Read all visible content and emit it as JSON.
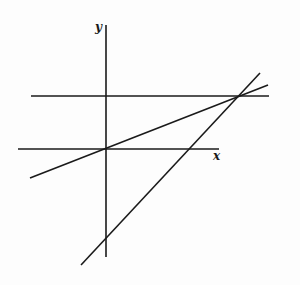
{
  "figure": {
    "width": 300,
    "height": 285,
    "background": "#fdfdfd",
    "stroke_color": "#1a1a1a"
  },
  "axes": {
    "x_label": "x",
    "y_label": "y",
    "origin": [
      106,
      149
    ],
    "x_axis": {
      "x1": 18,
      "y1": 149,
      "x2": 219,
      "y2": 149
    },
    "y_axis": {
      "x1": 106,
      "y1": 25,
      "x2": 106,
      "y2": 257
    },
    "x_label_pos": [
      213,
      160
    ],
    "y_label_pos": [
      95,
      31
    ]
  },
  "lines": [
    {
      "name": "horizontal-line",
      "description": "horizontal line above x-axis",
      "x1": 31,
      "y1": 96,
      "x2": 269,
      "y2": 96
    },
    {
      "name": "shallow-line",
      "description": "line through origin with small positive slope",
      "x1": 30,
      "y1": 178,
      "x2": 268,
      "y2": 85
    },
    {
      "name": "steep-line",
      "description": "line with larger positive slope crossing negative y-axis",
      "x1": 81,
      "y1": 265,
      "x2": 260,
      "y2": 73
    }
  ],
  "intersections": {
    "common_point": [
      240,
      96
    ],
    "shallow_line_origin": [
      106,
      149
    ],
    "steep_line_x_axis": [
      191,
      149
    ],
    "steep_line_y_axis": [
      106,
      238
    ]
  }
}
